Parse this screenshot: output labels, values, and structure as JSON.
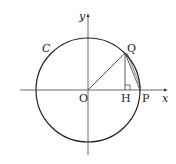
{
  "diagram": {
    "circle_label": "C",
    "axis_x_label": "x",
    "axis_y_label": "y",
    "points": {
      "origin": "O",
      "Q": "Q",
      "H": "H",
      "P": "P"
    },
    "colors": {
      "stroke": "#222222",
      "background": "#ffffff"
    }
  }
}
